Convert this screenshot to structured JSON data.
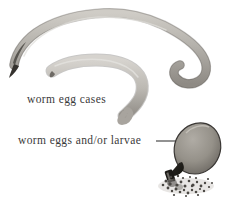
{
  "figure": {
    "background_color": "#ffffff",
    "ink_color": "#3a3a3a",
    "labels": [
      {
        "id": "egg-cases",
        "text": "worm egg cases"
      },
      {
        "id": "eggs-larvae",
        "text": "worm eggs and/or larvae"
      }
    ],
    "specimens": [
      {
        "name": "upper-worm-egg-case",
        "description": "long arched worm-shaped egg case with tapered pointed left tip and blunt hooked right end",
        "fill_color": "#b9b6b0",
        "outline_color": "#4a4743"
      },
      {
        "name": "lower-worm-egg-case",
        "description": "shorter J-shaped worm egg case curling downward",
        "fill_color": "#c6c3bd",
        "outline_color": "#4a4743"
      },
      {
        "name": "egg-sac",
        "description": "teardrop shaped sac with dark constricted neck discharging eggs",
        "fill_color": "#9a968f",
        "outline_color": "#3a3734"
      },
      {
        "name": "egg-pile",
        "description": "scattered speckled pile of worm eggs and larvae below the sac",
        "speck_color": "#4a4743"
      }
    ],
    "leader_line": {
      "name": "leader-line-to-egg-sac",
      "color": "#3a3a3a",
      "arrowhead": "right"
    }
  }
}
